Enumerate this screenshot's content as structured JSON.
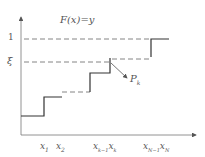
{
  "diagram": {
    "title": "F(x)=y",
    "y_labels": {
      "one": "1",
      "xi": "ξ"
    },
    "point_label": {
      "base": "P",
      "sub": "k"
    },
    "x_labels": [
      {
        "base": "x",
        "sub": "1"
      },
      {
        "base": "x",
        "sub": "2"
      },
      {
        "base": "x",
        "sub": "k−1"
      },
      {
        "base": "x",
        "sub": "k"
      },
      {
        "base": "x",
        "sub": "N−1"
      },
      {
        "base": "x",
        "sub": "N"
      }
    ],
    "colors": {
      "axis": "#777777",
      "step": "#333333",
      "dash": "#666666",
      "text": "#444444"
    }
  }
}
